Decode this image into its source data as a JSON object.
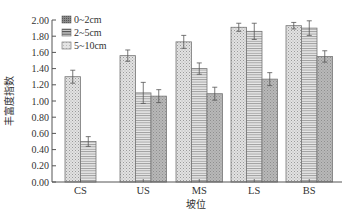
{
  "chart_data": {
    "type": "bar",
    "title": "",
    "xlabel": "坡位",
    "ylabel": "丰富度指数",
    "ylim": [
      0,
      2.0
    ],
    "yticks": [
      "0.00",
      "0.20",
      "0.40",
      "0.60",
      "0.80",
      "1.00",
      "1.20",
      "1.40",
      "1.60",
      "1.80",
      "2.00"
    ],
    "categories": [
      "CS",
      "US",
      "MS",
      "LS",
      "BS"
    ],
    "series": [
      {
        "name": "0~2cm",
        "values": [
          1.3,
          1.56,
          1.73,
          1.91,
          1.93
        ],
        "errors": [
          0.08,
          0.07,
          0.08,
          0.05,
          0.04
        ]
      },
      {
        "name": "2~5cm",
        "values": [
          0.5,
          1.1,
          1.4,
          1.86,
          1.9
        ],
        "errors": [
          0.06,
          0.13,
          0.07,
          0.1,
          0.09
        ]
      },
      {
        "name": "5~10cm",
        "values": [
          null,
          1.06,
          1.09,
          1.27,
          1.55
        ],
        "errors": [
          null,
          0.08,
          0.08,
          0.08,
          0.07
        ]
      }
    ],
    "legend_position": "upper-left",
    "grid": false
  }
}
